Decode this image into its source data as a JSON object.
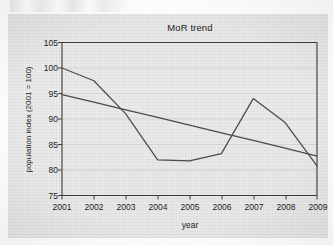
{
  "chart_data": {
    "type": "line",
    "title": "MoR trend",
    "xlabel": "year",
    "ylabel": "population index (2001 = 100)",
    "categories": [
      "2001",
      "2002",
      "2003",
      "2004",
      "2005",
      "2006",
      "2007",
      "2008",
      "2009"
    ],
    "x": [
      2001,
      2002,
      2003,
      2004,
      2005,
      2006,
      2007,
      2008,
      2009
    ],
    "xlim": [
      2001,
      2009
    ],
    "ylim": [
      75,
      105
    ],
    "yticks": [
      75,
      80,
      85,
      90,
      95,
      100,
      105
    ],
    "xticks": [
      "2001",
      "2002",
      "2003",
      "2004",
      "2005",
      "2006",
      "2007",
      "2008",
      "2009"
    ],
    "grid": true,
    "legend": "none",
    "series": [
      {
        "name": "population index",
        "color": "#4a4a4a",
        "values": [
          100.0,
          97.5,
          91.0,
          82.0,
          81.8,
          83.2,
          94.0,
          89.3,
          80.8
        ]
      },
      {
        "name": "linear trend",
        "color": "#4a4a4a",
        "values": [
          94.8,
          93.3,
          91.8,
          90.3,
          88.8,
          87.3,
          85.8,
          84.3,
          82.7
        ]
      }
    ]
  },
  "axes": {
    "y_tick_labels": [
      "105",
      "100",
      "95",
      "90",
      "85",
      "80",
      "75"
    ],
    "x_tick_labels": [
      "2001",
      "2002",
      "2003",
      "2004",
      "2005",
      "2006",
      "2007",
      "2008",
      "2009"
    ]
  },
  "colors": {
    "line": "#4a4a4a",
    "axis": "#3a3a3a",
    "grid": "#c9c9c9",
    "text": "#1d1d1d",
    "paper": "#ebebeb"
  }
}
